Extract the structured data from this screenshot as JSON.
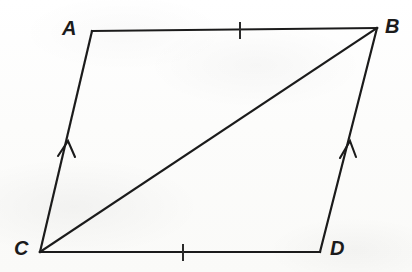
{
  "figure": {
    "kind": "geometry-diagram",
    "shape_name": "quadrilateral ABCD with diagonal CB",
    "stroke_color": "#1b1b1b",
    "background_color": "#fdfdfc",
    "vertices": [
      {
        "name": "A",
        "label": "A",
        "x": 92,
        "y": 31,
        "label_x": 62,
        "label_y": 18
      },
      {
        "name": "B",
        "label": "B",
        "x": 377,
        "y": 28,
        "label_x": 385,
        "label_y": 16
      },
      {
        "name": "C",
        "label": "C",
        "x": 40,
        "y": 252,
        "label_x": 14,
        "label_y": 238
      },
      {
        "name": "D",
        "label": "D",
        "x": 320,
        "y": 252,
        "label_x": 330,
        "label_y": 238
      }
    ],
    "edges": [
      {
        "name": "edge-AB",
        "from": "A",
        "to": "B",
        "label": "AB"
      },
      {
        "name": "edge-BD",
        "from": "B",
        "to": "D",
        "label": "BD"
      },
      {
        "name": "edge-DC",
        "from": "D",
        "to": "C",
        "label": "DC"
      },
      {
        "name": "edge-CA",
        "from": "C",
        "to": "A",
        "label": "CA"
      }
    ],
    "diagonal": {
      "name": "diagonal-CB",
      "from": "C",
      "to": "B",
      "label": "CB"
    },
    "tick_marks": [
      {
        "name": "tick-on-AB",
        "on_edge": "AB",
        "count": 1,
        "x": 240,
        "y": 30
      },
      {
        "name": "tick-on-CD",
        "on_edge": "DC",
        "count": 1,
        "x": 183,
        "y": 252
      }
    ],
    "arrow_marks": [
      {
        "name": "arrow-on-CA",
        "on_edge": "CA",
        "count": 1,
        "direction": "up",
        "x": 66,
        "y": 150
      },
      {
        "name": "arrow-on-DB",
        "on_edge": "DB",
        "count": 1,
        "direction": "up",
        "x": 347,
        "y": 150
      }
    ]
  }
}
